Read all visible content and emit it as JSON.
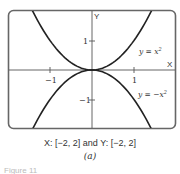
{
  "chart_data": {
    "type": "line",
    "title": "",
    "xlabel": "X",
    "ylabel": "Y",
    "xlim": [
      -2,
      2
    ],
    "ylim": [
      -2,
      2
    ],
    "x_ticks": [
      -1,
      1
    ],
    "y_ticks": [
      -1,
      1
    ],
    "x_tick_labels": [
      "−1",
      "1"
    ],
    "y_tick_labels": [
      "−1",
      "1"
    ],
    "grid": false,
    "series": [
      {
        "name": "y = x²",
        "x": [
          -2,
          -1.5,
          -1,
          -0.5,
          0,
          0.5,
          1,
          1.5,
          2
        ],
        "values": [
          4,
          2.25,
          1,
          0.25,
          0,
          0.25,
          1,
          2.25,
          4
        ]
      },
      {
        "name": "y = −x²",
        "x": [
          -2,
          -1.5,
          -1,
          -0.5,
          0,
          0.5,
          1,
          1.5,
          2
        ],
        "values": [
          -4,
          -2.25,
          -1,
          -0.25,
          0,
          -0.25,
          -1,
          -2.25,
          -4
        ]
      }
    ],
    "annotations": [
      "y = x²",
      "y = −x²"
    ]
  },
  "labels": {
    "x_axis": "X",
    "y_axis": "Y",
    "tick_x_neg1": "−1",
    "tick_x_pos1": "1",
    "tick_y_pos1": "1",
    "tick_y_neg1": "−1",
    "curve_upper": "y = x",
    "curve_lower": "y = −x",
    "exponent": "2"
  },
  "caption": "X: [−2, 2] and Y: [−2, 2]",
  "subcaption": "(a)",
  "figure_label": "Figure 11"
}
